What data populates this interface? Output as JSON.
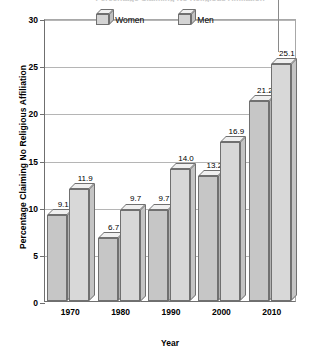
{
  "figure": {
    "clipped_title": "Percentage Claiming No Religious Affiliation",
    "xlabel": "Year",
    "ylabel": "Percentage Claiming No Religious Affiliation"
  },
  "legend": {
    "position": "top-center",
    "entries": [
      {
        "label": "Women",
        "color": "#c6c6c6"
      },
      {
        "label": "Men",
        "color": "#d8d8d8"
      }
    ]
  },
  "axis": {
    "y_ticks": [
      "0",
      "5",
      "10",
      "15",
      "20",
      "25",
      "30"
    ],
    "x_ticks": [
      "1970",
      "1980",
      "1990",
      "2000",
      "2010"
    ]
  },
  "chart_data": {
    "type": "bar",
    "title": "Percentage Claiming No Religious Affiliation",
    "xlabel": "Year",
    "ylabel": "Percentage Claiming No Religious Affiliation",
    "categories": [
      "1970",
      "1980",
      "1990",
      "2000",
      "2010"
    ],
    "ylim": [
      0,
      30
    ],
    "ytick_values": [
      0,
      5,
      10,
      15,
      20,
      25,
      30
    ],
    "grid": true,
    "legend_position": "top-center",
    "series": [
      {
        "name": "Women",
        "color": "#c6c6c6",
        "values": [
          9.1,
          6.7,
          9.7,
          13.2,
          21.2
        ],
        "labels": [
          "9.1",
          "6.7",
          "9.7",
          "13.2",
          "21.2"
        ]
      },
      {
        "name": "Men",
        "color": "#d8d8d8",
        "values": [
          11.9,
          9.7,
          14.0,
          16.9,
          25.1
        ],
        "labels": [
          "11.9",
          "9.7",
          "14.0",
          "16.9",
          "25.1"
        ]
      }
    ]
  }
}
